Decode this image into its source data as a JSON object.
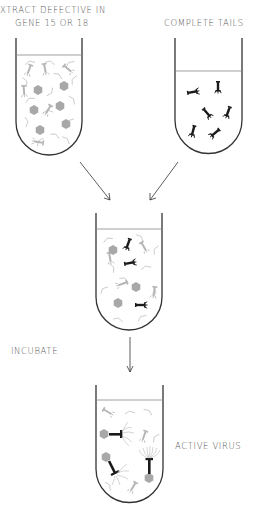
{
  "labels": {
    "extract_line1": "XTRACT DEFECTIVE IN",
    "extract_line2": "GENE 15 OR 18",
    "complete_tails": "COMPLETE TAILS",
    "incubate": "INCUBATE",
    "active_virus": "ACTIVE VIRUS"
  },
  "colors": {
    "outline": "#333333",
    "gray_component": "#b0b0b0",
    "black_tail": "#1a1a1a",
    "text": "#555555"
  },
  "tubes": [
    {
      "id": "extract-tube",
      "contents": "gray heads, gray tails, tail fibers"
    },
    {
      "id": "complete-tails-tube",
      "contents": "black complete tails"
    },
    {
      "id": "mixture-tube",
      "contents": "heads, gray parts, black tails"
    },
    {
      "id": "active-virus-tube",
      "contents": "assembled active virus particles"
    }
  ]
}
